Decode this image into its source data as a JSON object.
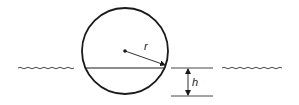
{
  "diagram": {
    "labels": {
      "radius": "r",
      "depth": "h"
    },
    "colors": {
      "stroke": "#1a1a1a",
      "background": "#ffffff"
    },
    "geometry": {
      "circle_center": [
        125,
        51
      ],
      "circle_radius": 43,
      "waterline_y": 68,
      "depth_bottom_y": 96
    }
  }
}
